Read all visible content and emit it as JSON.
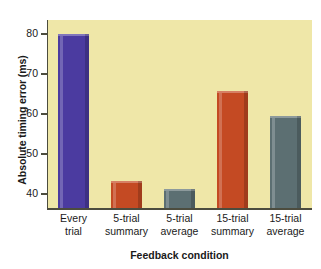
{
  "chart_data": {
    "type": "bar",
    "title": "",
    "xlabel": "Feedback condition",
    "ylabel": "Absolute timing error (ms)",
    "categories": [
      "Every trial",
      "5-trial summary",
      "5-trial average",
      "15-trial summary",
      "15-trial average"
    ],
    "category_lines": [
      [
        "Every",
        "trial"
      ],
      [
        "5-trial",
        "summary"
      ],
      [
        "5-trial",
        "average"
      ],
      [
        "15-trial",
        "summary"
      ],
      [
        "15-trial",
        "average"
      ]
    ],
    "values": [
      80.0,
      43.3,
      41.2,
      65.8,
      59.4
    ],
    "ylim": [
      36.5,
      83.5
    ],
    "yticks": [
      40,
      50,
      60,
      70,
      80
    ],
    "ytick_labels": [
      "40",
      "50",
      "60",
      "70",
      "80"
    ],
    "grid": false,
    "legend": "none",
    "bar_colors": [
      "#4b3ba0",
      "#c44a23",
      "#5c6f72",
      "#c44a23",
      "#5c6f72"
    ],
    "plot_background": "#efe7a8",
    "axis_color": "#4c4c3e",
    "figure_background": "#ffffff"
  }
}
